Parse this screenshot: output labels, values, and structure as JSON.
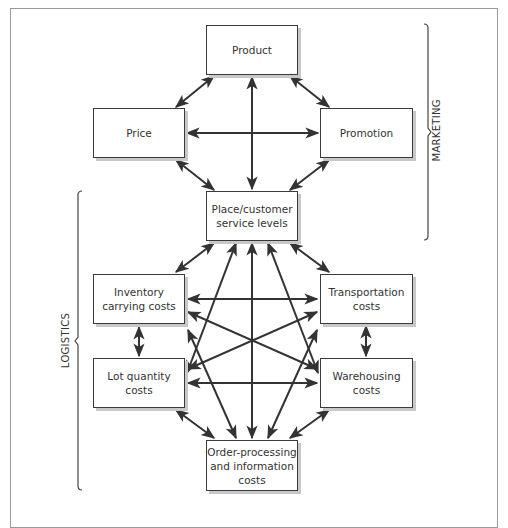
{
  "diagram": {
    "groups": {
      "marketing": "MARKETING",
      "logistics": "LOGISTICS"
    },
    "nodes": {
      "product": "Product",
      "price": "Price",
      "promotion": "Promotion",
      "place": "Place/customer\nservice levels",
      "inventory": "Inventory\ncarrying costs",
      "transportation": "Transportation\ncosts",
      "lot_quantity": "Lot quantity\ncosts",
      "warehousing": "Warehousing\ncosts",
      "order_processing": "Order-processing\nand information\ncosts"
    },
    "edges": [
      [
        "product",
        "price"
      ],
      [
        "product",
        "promotion"
      ],
      [
        "product",
        "place"
      ],
      [
        "price",
        "promotion"
      ],
      [
        "price",
        "place"
      ],
      [
        "promotion",
        "place"
      ],
      [
        "place",
        "inventory"
      ],
      [
        "place",
        "transportation"
      ],
      [
        "place",
        "lot_quantity"
      ],
      [
        "place",
        "warehousing"
      ],
      [
        "place",
        "order_processing"
      ],
      [
        "inventory",
        "transportation"
      ],
      [
        "inventory",
        "lot_quantity"
      ],
      [
        "inventory",
        "warehousing"
      ],
      [
        "inventory",
        "order_processing"
      ],
      [
        "transportation",
        "warehousing"
      ],
      [
        "transportation",
        "lot_quantity"
      ],
      [
        "transportation",
        "order_processing"
      ],
      [
        "lot_quantity",
        "warehousing"
      ],
      [
        "lot_quantity",
        "order_processing"
      ],
      [
        "warehousing",
        "order_processing"
      ]
    ],
    "colors": {
      "line": "#333333",
      "frame": "#9a9a9a",
      "shadow": "#c8c8c8"
    }
  }
}
